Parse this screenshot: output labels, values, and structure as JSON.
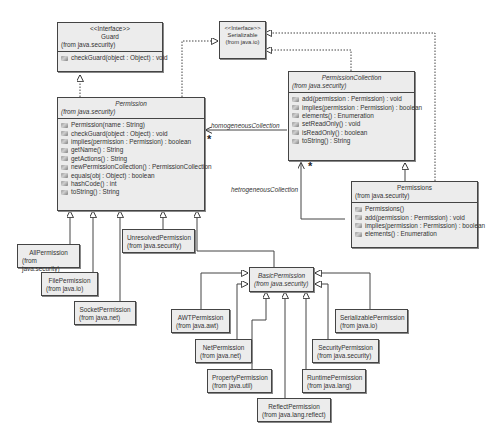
{
  "diagram": {
    "type": "UML class diagram",
    "classes": {
      "guard": {
        "stereotype": "<<Interface>>",
        "name": "Guard",
        "package": "(from java.security)",
        "operations": [
          "checkGuard(object : Object) : void"
        ]
      },
      "serializable": {
        "stereotype": "<<Interface>>",
        "name": "Serializable",
        "package": "(from java.io)"
      },
      "permission": {
        "name": "Permission",
        "package": "(from java.security)",
        "abstract": true,
        "operations": [
          "Permission(name : String)",
          "checkGuard(object : Object) : void",
          "implies(permission : Permission) : boolean",
          "getName() : String",
          "getActions() : String",
          "newPermissionCollection() : PermissionCollection",
          "equals(obj : Object) : boolean",
          "hashCode() : int",
          "toString() : String"
        ]
      },
      "permission_collection": {
        "name": "PermissionCollection",
        "package": "(from java.security)",
        "abstract": true,
        "operations": [
          "add(permission : Permission) : void",
          "implies(permission : Permission) : boolean",
          "elements() : Enumeration",
          "setReadOnly() : void",
          "isReadOnly() : boolean",
          "toString() : String"
        ]
      },
      "permissions": {
        "name": "Permissions",
        "package": "(from java.security)",
        "operations": [
          "Permissions()",
          "add(permission : Permission) : void",
          "implies(permission : Permission) : boolean",
          "elements() : Enumeration"
        ]
      },
      "all_permission": {
        "name": "AllPermission",
        "package": "(from java.security)"
      },
      "file_permission": {
        "name": "FilePermission",
        "package": "(from java.io)"
      },
      "socket_permission": {
        "name": "SocketPermission",
        "package": "(from java.net)"
      },
      "unresolved_permission": {
        "name": "UnresolvedPermission",
        "package": "(from java.security)"
      },
      "basic_permission": {
        "name": "BasicPermission",
        "package": "(from java.security)",
        "abstract": true
      },
      "awt_permission": {
        "name": "AWTPermission",
        "package": "(from java.awt)"
      },
      "net_permission": {
        "name": "NetPermission",
        "package": "(from java.net)"
      },
      "property_permission": {
        "name": "PropertyPermission",
        "package": "(from java.util)"
      },
      "reflect_permission": {
        "name": "ReflectPermission",
        "package": "(from java.lang.reflect)"
      },
      "runtime_permission": {
        "name": "RuntimePermission",
        "package": "(from java.lang)"
      },
      "security_permission": {
        "name": "SecurityPermission",
        "package": "(from java.security)"
      },
      "serializable_permission": {
        "name": "SerializablePermission",
        "package": "(from java.io)"
      }
    },
    "associations": {
      "homogeneous": {
        "label": "homogeneousCollection",
        "multiplicity": "*"
      },
      "heterogeneous": {
        "label": "hetrogeneousCollection",
        "multiplicity": "*"
      }
    }
  }
}
